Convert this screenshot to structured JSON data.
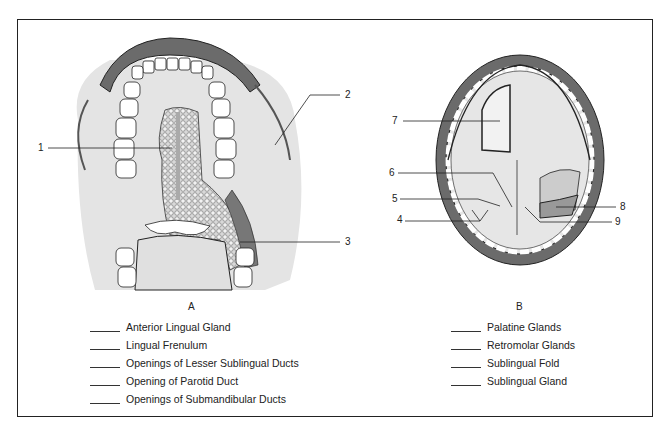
{
  "figure_a": {
    "caption": "A",
    "callouts": [
      "1",
      "2",
      "3"
    ],
    "answer_key": [
      "Anterior Lingual Gland",
      "Lingual Frenulum",
      "Openings of Lesser Sublingual Ducts",
      "Opening of Parotid Duct",
      "Openings of Submandibular Ducts"
    ]
  },
  "figure_b": {
    "caption": "B",
    "callouts": [
      "4",
      "5",
      "6",
      "7",
      "8",
      "9"
    ],
    "answer_key": [
      "Palatine Glands",
      "Retromolar Glands",
      "Sublingual Fold",
      "Sublingual Gland"
    ]
  },
  "colors": {
    "gum": "#6b6b6b",
    "mucosa": "#e6e6e6",
    "outline": "#222222"
  }
}
